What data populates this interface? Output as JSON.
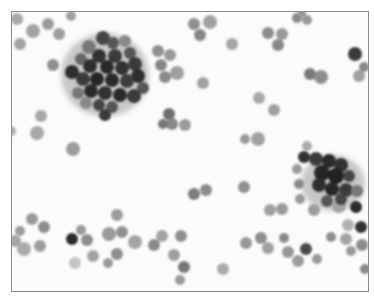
{
  "image": {
    "subject": "cytology smear micrograph",
    "description": "Grayscale photomicrograph of scattered round cells with two dense dark cell clusters",
    "colors": {
      "background": "#fbfbfb",
      "frame": "#8a8a8a",
      "cell_light": "#9a9a9a",
      "cell_medium": "#6e6e6e",
      "cell_dark": "#2a2a2a"
    },
    "clusters": [
      {
        "name": "upper-left-cluster",
        "cx": 104,
        "cy": 72,
        "r": 42
      },
      {
        "name": "right-cluster",
        "cx": 333,
        "cy": 182,
        "r": 30
      }
    ]
  }
}
